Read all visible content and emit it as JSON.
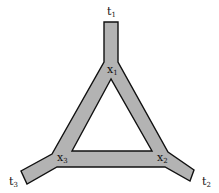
{
  "diagram": {
    "type": "network-triangle",
    "colors": {
      "fill": "#b3b3b3",
      "stroke": "#111111",
      "background": "#ffffff"
    },
    "nodes": {
      "x1": {
        "base": "x",
        "sub": "1"
      },
      "x2": {
        "base": "x",
        "sub": "2"
      },
      "x3": {
        "base": "x",
        "sub": "3"
      },
      "t1": {
        "base": "t",
        "sub": "1"
      },
      "t2": {
        "base": "t",
        "sub": "2"
      },
      "t3": {
        "base": "t",
        "sub": "3"
      }
    }
  }
}
